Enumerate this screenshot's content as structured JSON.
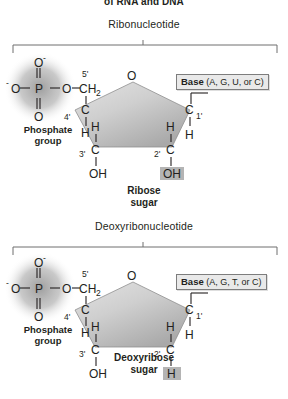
{
  "figure": {
    "clipped_header": "of RNA and DNA",
    "background_color": "#ffffff",
    "ink_color": "#231f20",
    "highlight_color": "#b4b4b4",
    "sugar_ring_fill": "#c9c9c9",
    "phosphate_glow_color": "#9a9a9a"
  },
  "panels": [
    {
      "id": "ribonucleotide",
      "title": "Ribonucleotide",
      "phosphate": {
        "label_line1": "Phosphate",
        "label_line2": "group",
        "center_atom": "P",
        "top_oxygen": "O",
        "top_charge": "-",
        "left_oxygen": "O",
        "left_charge": "-",
        "bottom_oxygen": "O",
        "ester_oxygen": "O"
      },
      "sugar": {
        "name_line1": "Ribose",
        "name_line2": "sugar",
        "ring_oxygen": "O",
        "c5_label": "CH",
        "c5_sub": "2",
        "c5_prime": "5'",
        "c4_label": "C",
        "c4_prime": "4'",
        "c4_h": "H",
        "c3_label": "C",
        "c3_prime": "3'",
        "c3_h": "H",
        "c3_oh": "OH",
        "c2_label": "C",
        "c2_prime": "2'",
        "c2_h": "H",
        "c2_group": "OH",
        "c2_group_highlighted": true,
        "c1_label": "C",
        "c1_prime": "1'",
        "c1_h": "H"
      },
      "base": {
        "label": "Base",
        "options": "(A, G, U, or C)"
      }
    },
    {
      "id": "deoxyribonucleotide",
      "title": "Deoxyribonucleotide",
      "phosphate": {
        "label_line1": "Phosphate",
        "label_line2": "group",
        "center_atom": "P",
        "top_oxygen": "O",
        "top_charge": "-",
        "left_oxygen": "O",
        "left_charge": "-",
        "bottom_oxygen": "O",
        "ester_oxygen": "O"
      },
      "sugar": {
        "name_line1": "Deoxyribose",
        "name_line2": "sugar",
        "ring_oxygen": "O",
        "c5_label": "CH",
        "c5_sub": "2",
        "c5_prime": "5'",
        "c4_label": "C",
        "c4_prime": "4'",
        "c4_h": "H",
        "c3_label": "C",
        "c3_prime": "3'",
        "c3_h": "H",
        "c3_oh": "OH",
        "c2_label": "C",
        "c2_prime": "2'",
        "c2_h": "H",
        "c2_group": "H",
        "c2_group_highlighted": true,
        "c1_label": "C",
        "c1_prime": "1'",
        "c1_h": "H"
      },
      "base": {
        "label": "Base",
        "options": "(A, G, T, or C)"
      }
    }
  ]
}
